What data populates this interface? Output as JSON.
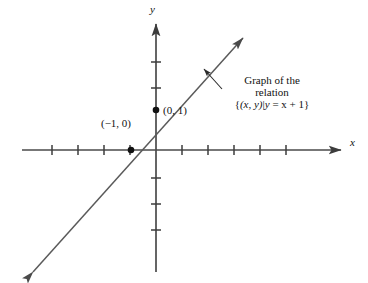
{
  "figure": {
    "kind": "cartesian-coordinate-diagram",
    "background_color": "#ffffff",
    "ink_color": "#3c3c3c",
    "text_color": "#111111",
    "width": 368,
    "height": 283
  },
  "axes": {
    "x_axis_label": "x",
    "y_axis_label": "y",
    "origin_px": {
      "x": 156,
      "y": 150
    },
    "unit_px": 26,
    "x_ticks_left": 4,
    "x_ticks_right": 5,
    "y_ticks_above": 2,
    "y_ticks_below": 3,
    "tick_half_length": 5,
    "grid": "off"
  },
  "graph": {
    "equation_label": "y = x + 1",
    "slope": 1,
    "intercept": 1,
    "arrowheads": "both",
    "start_px": {
      "x": 33,
      "y": 272
    },
    "end_px": {
      "x": 243,
      "y": 38
    }
  },
  "points": [
    {
      "name": "x-intercept",
      "label": "(−1, 0)",
      "x": -1,
      "y": 0,
      "px": {
        "x": 131,
        "y": 150
      },
      "label_px": {
        "x": 101,
        "y": 125
      }
    },
    {
      "name": "y-intercept",
      "label": "(0, 1)",
      "x": 0,
      "y": 1,
      "px": {
        "x": 156,
        "y": 110
      },
      "label_px": {
        "x": 162,
        "y": 112
      }
    }
  ],
  "annotation": {
    "line1": "Graph of the",
    "line2": "relation",
    "set_open": "{",
    "set_pair": "(x, y)",
    "set_bar": "|",
    "set_expr_y": "y",
    "set_expr_rest": " = x + 1",
    "set_close": "}",
    "set_notation_plain": "{(x, y)|y = x + 1}",
    "leader_from_px": {
      "x": 222,
      "y": 89
    },
    "leader_to_px": {
      "x": 202,
      "y": 67
    }
  },
  "axis_label_positions": {
    "y_label_px": {
      "x": 152,
      "y": 10
    },
    "x_label_px": {
      "x": 350,
      "y": 143
    }
  }
}
